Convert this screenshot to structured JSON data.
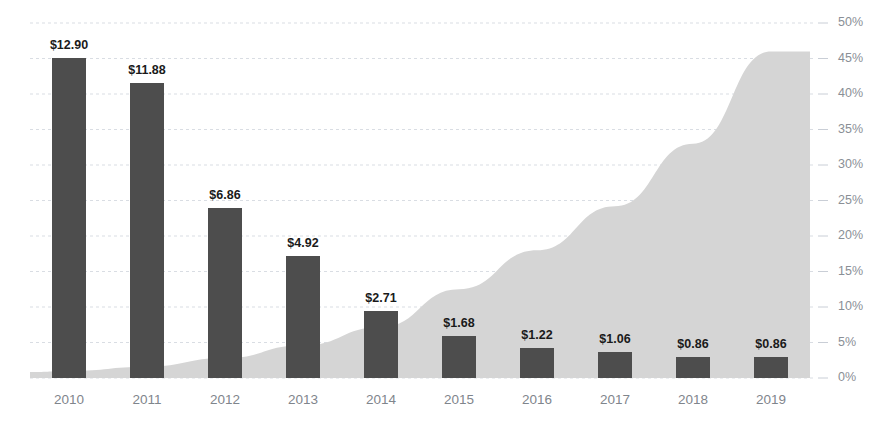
{
  "chart_data": {
    "type": "bar",
    "title": "",
    "subtitle": "",
    "xlabel": "",
    "ylabel": "",
    "categories": [
      "2010",
      "2011",
      "2012",
      "2013",
      "2014",
      "2015",
      "2016",
      "2017",
      "2018",
      "2019"
    ],
    "series": [
      {
        "name": "Price",
        "type": "bar",
        "color": "#4d4d4d",
        "axis": "left",
        "values": [
          12.9,
          11.88,
          6.86,
          4.92,
          2.71,
          1.68,
          1.22,
          1.06,
          0.86,
          0.86
        ],
        "labels": [
          "$12.90",
          "$11.88",
          "$6.86",
          "$4.92",
          "$2.71",
          "$1.68",
          "$1.22",
          "$1.06",
          "$0.86",
          "$0.86"
        ],
        "ylim": [
          0,
          14.3
        ]
      },
      {
        "name": "Share",
        "type": "area",
        "color": "#d5d5d5",
        "axis": "right",
        "values": [
          1.0,
          1.6,
          2.8,
          4.6,
          7.2,
          12.5,
          18.0,
          24.2,
          33.0,
          46.0
        ],
        "ylim": [
          0,
          50
        ]
      }
    ],
    "right_axis": {
      "ticks": [
        0,
        5,
        10,
        15,
        20,
        25,
        30,
        35,
        40,
        45,
        50
      ],
      "tick_labels": [
        "0%",
        "5%",
        "10%",
        "15%",
        "20%",
        "25%",
        "30%",
        "35%",
        "40%",
        "45%",
        "50%"
      ],
      "range": [
        0,
        50
      ]
    },
    "grid": true,
    "legend": "none",
    "colors": {
      "bar": "#4d4d4d",
      "area": "#d5d5d5",
      "gridline": "#d9dde3",
      "axis_text": "#8a8f96",
      "label_text": "#1a1a1a",
      "background": "#ffffff"
    }
  }
}
